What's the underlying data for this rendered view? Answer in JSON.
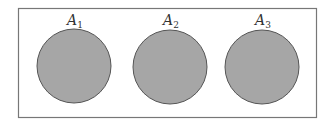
{
  "diagram": {
    "type": "venn-disjoint-sets",
    "universe_box": {
      "x": 18,
      "y": 8,
      "width": 298,
      "height": 109,
      "stroke": "#777777"
    },
    "circle_fill": "#a6a6a6",
    "circle_stroke": "#555555",
    "sets": [
      {
        "label": "A",
        "subscript": "1",
        "cx": 74,
        "cy": 66,
        "r": 37
      },
      {
        "label": "A",
        "subscript": "2",
        "cx": 170,
        "cy": 67,
        "r": 37
      },
      {
        "label": "A",
        "subscript": "3",
        "cx": 262,
        "cy": 67,
        "r": 37
      }
    ]
  }
}
